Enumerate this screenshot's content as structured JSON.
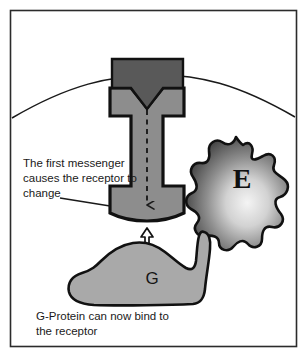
{
  "figure": {
    "width": 306,
    "height": 355,
    "background": "#ffffff",
    "border_color": "#2b2b2b"
  },
  "colors": {
    "outline": "#111111",
    "first_messenger_fill": "#595959",
    "receptor_fill": "#8d8d8d",
    "g_protein_fill": "#a9a9a9",
    "enzyme_edge": "#4a4a4a",
    "enzyme_center": "#f2f2f2",
    "membrane_line": "#1a1a1a",
    "text": "#1a1a1a",
    "page_background": "#ffffff"
  },
  "annotations": {
    "messenger_caption_lines": [
      "The first messenger",
      "causes the receptor to",
      "change"
    ],
    "gprotein_caption_lines": [
      "G-Protein can now bind to",
      "the receptor"
    ]
  },
  "shapes": {
    "first_messenger": {
      "name": "first-messenger",
      "label": "",
      "fill": "#595959"
    },
    "receptor": {
      "name": "receptor",
      "label": "",
      "fill": "#8d8d8d"
    },
    "g_protein": {
      "name": "g-protein",
      "label": "G",
      "fill": "#a9a9a9"
    },
    "enzyme": {
      "name": "enzyme",
      "label": "E",
      "fill": "gradient"
    },
    "membrane": {
      "name": "cell-membrane",
      "label": ""
    },
    "signal_arrow": {
      "name": "signal-transduction-arrow",
      "style": "dashed-down-arrow"
    },
    "binding_arrow": {
      "name": "binding-double-arrow",
      "style": "double-headed-vertical"
    },
    "leader_line": {
      "name": "caption-leader-line",
      "style": "solid-diagonal"
    }
  }
}
